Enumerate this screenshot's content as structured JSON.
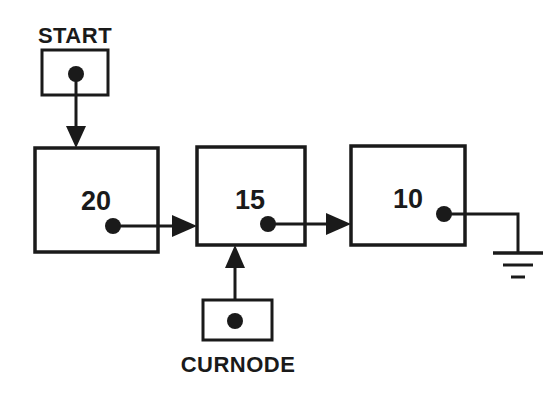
{
  "diagram": {
    "colors": {
      "stroke": "#1a1a1a",
      "background": "#ffffff"
    },
    "pointer_boxes": [
      {
        "id": "start",
        "label": "START",
        "label_position": "above",
        "box": {
          "x": 42,
          "y": 50,
          "w": 66,
          "h": 45
        },
        "dot": {
          "cx": 76,
          "cy": 74,
          "r": 8
        },
        "label_anchor": {
          "x": 75,
          "y": 43
        }
      },
      {
        "id": "curnode",
        "label": "CURNODE",
        "label_position": "below",
        "box": {
          "x": 203,
          "y": 300,
          "w": 69,
          "h": 40
        },
        "dot": {
          "cx": 235,
          "cy": 321,
          "r": 8
        },
        "label_anchor": {
          "x": 238,
          "y": 372
        }
      }
    ],
    "nodes": [
      {
        "id": "node-20",
        "value": "20",
        "box": {
          "x": 35,
          "y": 148,
          "w": 123,
          "h": 104
        },
        "value_anchor": {
          "x": 96,
          "y": 210
        },
        "dot": {
          "cx": 113,
          "cy": 226,
          "r": 8
        }
      },
      {
        "id": "node-15",
        "value": "15",
        "box": {
          "x": 197,
          "y": 147,
          "w": 108,
          "h": 98
        },
        "value_anchor": {
          "x": 250,
          "y": 209
        },
        "dot": {
          "cx": 268,
          "cy": 224,
          "r": 8
        }
      },
      {
        "id": "node-10",
        "value": "10",
        "box": {
          "x": 351,
          "y": 146,
          "w": 114,
          "h": 99
        },
        "value_anchor": {
          "x": 408,
          "y": 208
        },
        "dot": {
          "cx": 444,
          "cy": 214,
          "r": 8
        }
      }
    ],
    "links": [
      {
        "id": "start-to-node20",
        "from": "start",
        "to": "node-20",
        "orientation": "vertical-down",
        "path": "M 76 74 L 76 146",
        "arrow_tip": {
          "x": 76,
          "y": 148
        },
        "arrow_direction": "down"
      },
      {
        "id": "node20-to-node15",
        "from": "node-20",
        "to": "node-15",
        "orientation": "horizontal-right",
        "path": "M 113 226 L 195 226",
        "arrow_tip": {
          "x": 197,
          "y": 226
        },
        "arrow_direction": "right"
      },
      {
        "id": "node15-to-node10",
        "from": "node-15",
        "to": "node-10",
        "orientation": "horizontal-right",
        "path": "M 268 224 L 349 224",
        "arrow_tip": {
          "x": 351,
          "y": 224
        },
        "arrow_direction": "right"
      },
      {
        "id": "curnode-to-node15",
        "from": "curnode",
        "to": "node-15",
        "orientation": "vertical-up",
        "path": "M 235 321 L 235 249",
        "arrow_tip": {
          "x": 235,
          "y": 245
        },
        "arrow_direction": "up"
      },
      {
        "id": "node10-to-ground",
        "from": "node-10",
        "to": "ground",
        "orientation": "elbow-right-down",
        "path": "M 444 214 L 518 214 L 518 252",
        "arrow_tip": null,
        "arrow_direction": "none"
      }
    ],
    "ground": {
      "id": "null-ground",
      "meaning": "null-terminator",
      "stem": {
        "x": 518,
        "y_top": 214,
        "y_bottom": 252
      },
      "bars": [
        {
          "cx": 518,
          "y": 253,
          "w": 50
        },
        {
          "cx": 518,
          "y": 265,
          "w": 30
        },
        {
          "cx": 518,
          "y": 277,
          "w": 14
        }
      ]
    }
  }
}
